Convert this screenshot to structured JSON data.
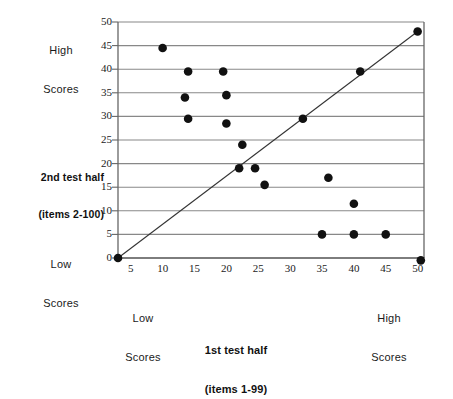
{
  "chart_data": {
    "type": "scatter",
    "title": "",
    "xlabel": "1st test half (items 1-99)",
    "ylabel": "2nd test half (items 2-100)",
    "xlabel_line1": "1st test half",
    "xlabel_line2": "(items 1-99)",
    "ylabel_line1": "2nd test half",
    "ylabel_line2": "(items 2-100)",
    "xlim": [
      3,
      51
    ],
    "ylim": [
      -1,
      50
    ],
    "xticks": [
      5,
      10,
      15,
      20,
      25,
      30,
      35,
      40,
      45,
      50
    ],
    "yticks": [
      0,
      5,
      10,
      15,
      20,
      25,
      30,
      35,
      40,
      45,
      50
    ],
    "grid": "horizontal",
    "legend": "none",
    "marker_color": "#111111",
    "gridline_color": "#888888",
    "axis_color": "#666666",
    "reference_line": {
      "name": "identity-diagonal",
      "from": [
        3,
        0
      ],
      "to": [
        50,
        48
      ]
    },
    "points": [
      {
        "x": 3,
        "y": 0
      },
      {
        "x": 10,
        "y": 44.5
      },
      {
        "x": 14,
        "y": 39.5
      },
      {
        "x": 19.5,
        "y": 39.5
      },
      {
        "x": 13.5,
        "y": 34
      },
      {
        "x": 20,
        "y": 34.5
      },
      {
        "x": 14,
        "y": 29.5
      },
      {
        "x": 20,
        "y": 28.5
      },
      {
        "x": 22.5,
        "y": 24
      },
      {
        "x": 22,
        "y": 19
      },
      {
        "x": 24.5,
        "y": 19
      },
      {
        "x": 26,
        "y": 15.5
      },
      {
        "x": 32,
        "y": 29.5
      },
      {
        "x": 36,
        "y": 17
      },
      {
        "x": 40,
        "y": 11.5
      },
      {
        "x": 35,
        "y": 5
      },
      {
        "x": 40,
        "y": 5
      },
      {
        "x": 45,
        "y": 5
      },
      {
        "x": 41,
        "y": 39.5
      },
      {
        "x": 50,
        "y": 48
      },
      {
        "x": 50.5,
        "y": -0.5
      }
    ],
    "annotations": {
      "y_high": "High\nScores",
      "y_low": "Low\nScores",
      "x_low": "Low\nScores",
      "x_high": "High\nScores"
    }
  },
  "labels": {
    "y_high_line1": "High",
    "y_high_line2": "Scores",
    "y_low_line1": "Low",
    "y_low_line2": "Scores",
    "x_low_line1": "Low",
    "x_low_line2": "Scores",
    "x_high_line1": "High",
    "x_high_line2": "Scores"
  }
}
